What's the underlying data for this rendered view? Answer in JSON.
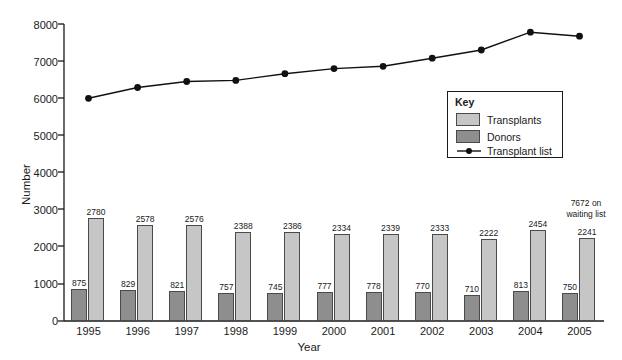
{
  "chart_data": {
    "type": "bar",
    "title": "",
    "xlabel": "Year",
    "ylabel": "Number",
    "categories": [
      "1995",
      "1996",
      "1997",
      "1998",
      "1999",
      "2000",
      "2001",
      "2002",
      "2003",
      "2004",
      "2005"
    ],
    "ylim": [
      0,
      8000
    ],
    "ytick_labels": [
      "0",
      "1000",
      "2000",
      "3000",
      "4000",
      "5000",
      "6000",
      "7000",
      "8000"
    ],
    "ytick_values": [
      0,
      1000,
      2000,
      3000,
      4000,
      5000,
      6000,
      7000,
      8000
    ],
    "grid": false,
    "legend_position": "center-right",
    "series": [
      {
        "name": "Donors",
        "type": "bar",
        "color": "#8e8e8e",
        "values": [
          875,
          829,
          821,
          757,
          745,
          777,
          778,
          770,
          710,
          813,
          750
        ],
        "labels": [
          "875",
          "829",
          "821",
          "757",
          "745",
          "777",
          "778",
          "770",
          "710",
          "813",
          "750"
        ]
      },
      {
        "name": "Transplants",
        "type": "bar",
        "color": "#c6c6c6",
        "values": [
          2780,
          2578,
          2576,
          2388,
          2386,
          2334,
          2339,
          2333,
          2222,
          2454,
          2241
        ],
        "labels": [
          "2780",
          "2578",
          "2576",
          "2388",
          "2386",
          "2334",
          "2339",
          "2333",
          "2222",
          "2454",
          "2241"
        ]
      },
      {
        "name": "Transplant list",
        "type": "line",
        "color": "#111111",
        "values": [
          6000,
          6290,
          6450,
          6480,
          6660,
          6800,
          6860,
          7080,
          7300,
          7780,
          7672
        ]
      }
    ],
    "annotations": [
      {
        "text_line1": "7672 on",
        "text_line2": "waiting list",
        "target_year": "2005"
      }
    ]
  },
  "legend": {
    "title": "Key",
    "items": [
      {
        "label": "Transplants",
        "marker": "swatch-light"
      },
      {
        "label": "Donors",
        "marker": "swatch-dark"
      },
      {
        "label": "Transplant list",
        "marker": "line-with-dot"
      }
    ]
  }
}
